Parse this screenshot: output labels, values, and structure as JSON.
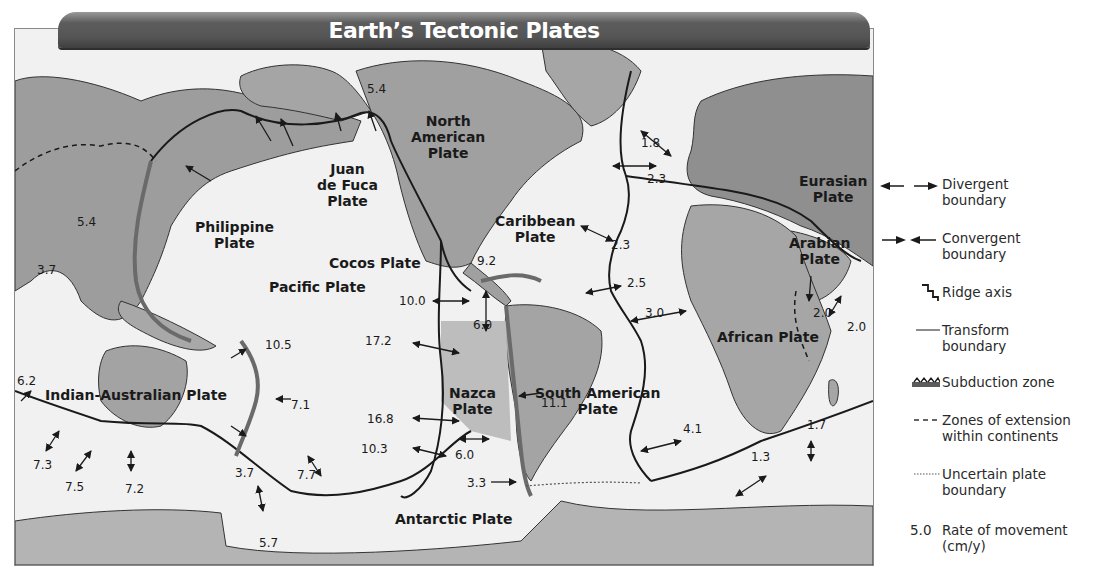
{
  "title": "Earth’s Tectonic Plates",
  "colors": {
    "ocean": "#f2f2f2",
    "land": "#a9a9a9",
    "land_dark": "#8e8e8e",
    "boundary": "#1a1a1a",
    "subduction": "#6a6a6a",
    "banner": "#555555",
    "banner_text": "#ffffff"
  },
  "plates": {
    "north_american": "North\nAmerican\nPlate",
    "eurasian": "Eurasian\nPlate",
    "juan_de_fuca": "Juan\nde Fuca\nPlate",
    "philippine": "Philippine\nPlate",
    "caribbean": "Caribbean\nPlate",
    "cocos": "Cocos Plate",
    "pacific": "Pacific Plate",
    "arabian": "Arabian\nPlate",
    "nazca": "Nazca\nPlate",
    "south_american": "South American\nPlate",
    "african": "African Plate",
    "indian_australian": "Indian-Australian Plate",
    "antarctic": "Antarctic Plate"
  },
  "rates": {
    "r_3_7_asia": "3.7",
    "r_5_4_asia": "5.4",
    "r_5_4_alaska": "5.4",
    "r_1_8": "1.8",
    "r_2_3_north": "2.3",
    "r_2_3_mid": "2.3",
    "r_2_5": "2.5",
    "r_3_0": "3.0",
    "r_9_2": "9.2",
    "r_10_0": "10.0",
    "r_6_0_cocos": "6.0",
    "r_17_2": "17.2",
    "r_10_5": "10.5",
    "r_7_1": "7.1",
    "r_6_2": "6.2",
    "r_16_8": "16.8",
    "r_10_3": "10.3",
    "r_6_0_nazca": "6.0",
    "r_11_1": "11.1",
    "r_3_3": "3.3",
    "r_3_7_nz": "3.7",
    "r_7_3": "7.3",
    "r_7_5": "7.5",
    "r_7_2": "7.2",
    "r_7_7": "7.7",
    "r_5_7": "5.7",
    "r_4_1": "4.1",
    "r_1_3": "1.3",
    "r_1_7": "1.7",
    "r_2_0_red_sea": "2.0",
    "r_2_0_east_africa": "2.0"
  },
  "legend": {
    "items": [
      {
        "symbol": "divergent-arrows",
        "label": "Divergent\nboundary"
      },
      {
        "symbol": "convergent-arrows",
        "label": "Convergent\nboundary"
      },
      {
        "symbol": "ridge-axis",
        "label": "Ridge axis"
      },
      {
        "symbol": "transform-line",
        "label": "Transform\nboundary"
      },
      {
        "symbol": "subduction-teeth",
        "label": "Subduction zone"
      },
      {
        "symbol": "dashed-line",
        "label": "Zones of extension\nwithin continents"
      },
      {
        "symbol": "dotted-line",
        "label": "Uncertain plate\nboundary"
      },
      {
        "symbol": "rate-number",
        "label": "Rate of movement\n(cm/y)",
        "sample_value": "5.0"
      }
    ]
  }
}
